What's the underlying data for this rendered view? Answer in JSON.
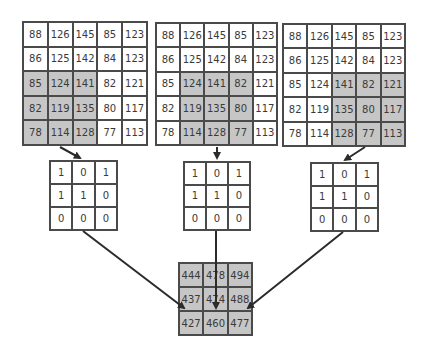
{
  "input_grids": [
    {
      "cells": [
        [
          88,
          126,
          145,
          85,
          123
        ],
        [
          86,
          125,
          142,
          84,
          123
        ],
        [
          85,
          124,
          141,
          82,
          121
        ],
        [
          82,
          119,
          135,
          80,
          117
        ],
        [
          78,
          114,
          128,
          77,
          113
        ]
      ],
      "highlight": {
        "rows": [
          2,
          4
        ],
        "cols": [
          0,
          2
        ]
      }
    },
    {
      "cells": [
        [
          88,
          126,
          145,
          85,
          123
        ],
        [
          86,
          125,
          142,
          84,
          123
        ],
        [
          85,
          124,
          141,
          82,
          121
        ],
        [
          82,
          119,
          135,
          80,
          117
        ],
        [
          78,
          114,
          128,
          77,
          113
        ]
      ],
      "highlight": {
        "rows": [
          2,
          4
        ],
        "cols": [
          1,
          3
        ]
      }
    },
    {
      "cells": [
        [
          88,
          126,
          145,
          85,
          123
        ],
        [
          86,
          125,
          142,
          84,
          123
        ],
        [
          85,
          124,
          141,
          82,
          121
        ],
        [
          82,
          119,
          135,
          80,
          117
        ],
        [
          78,
          114,
          128,
          77,
          113
        ]
      ],
      "highlight": {
        "rows": [
          2,
          4
        ],
        "cols": [
          2,
          4
        ]
      }
    }
  ],
  "kernels": [
    {
      "cells": [
        [
          1,
          0,
          1
        ],
        [
          1,
          1,
          0
        ],
        [
          0,
          0,
          0
        ]
      ]
    },
    {
      "cells": [
        [
          1,
          0,
          1
        ],
        [
          1,
          1,
          0
        ],
        [
          0,
          0,
          0
        ]
      ]
    },
    {
      "cells": [
        [
          1,
          0,
          1
        ],
        [
          1,
          1,
          0
        ],
        [
          0,
          0,
          0
        ]
      ]
    }
  ],
  "output": {
    "cells": [
      [
        444,
        478,
        494
      ],
      [
        437,
        474,
        488
      ],
      [
        427,
        460,
        477
      ]
    ]
  },
  "colors": {
    "highlight": "#c6c6c6",
    "border": "#4a4a4a",
    "arrow": "#2b2b2b"
  }
}
